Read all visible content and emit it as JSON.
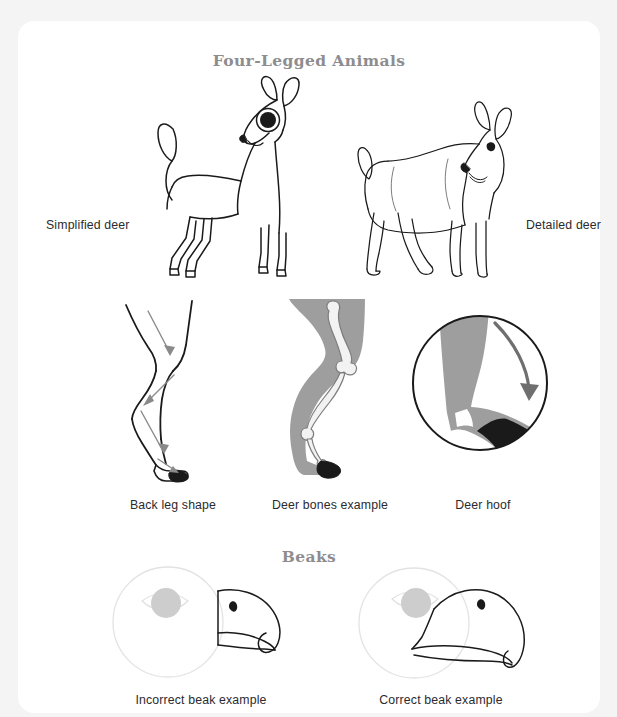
{
  "page": {
    "background_color": "#f4f4f5",
    "card_color": "#ffffff"
  },
  "colors": {
    "heading_gray": "#8d8d8f",
    "caption_dark": "#2b2b2f",
    "ink_black": "#1a1a1a",
    "silhouette_gray": "#9e9e9e",
    "arrow_gray": "#8a8a8a",
    "faint_outline": "#e2e2e4",
    "eye_fill_gray": "#c9c9c9"
  },
  "sections": [
    {
      "id": "four-legged-animals",
      "heading": "Four-Legged Animals",
      "rows": [
        {
          "id": "deer-bodies",
          "figures": [
            {
              "id": "simplified-deer",
              "caption": "Simplified deer",
              "caption_position": "left",
              "icon": "simplified-deer-illustration"
            },
            {
              "id": "detailed-deer",
              "caption": "Detailed deer",
              "caption_position": "right",
              "icon": "detailed-deer-illustration"
            }
          ]
        },
        {
          "id": "deer-anatomy",
          "figures": [
            {
              "id": "back-leg",
              "caption": "Back leg shape",
              "caption_position": "below",
              "icon": "deer-back-leg-illustration"
            },
            {
              "id": "deer-bones",
              "caption": "Deer bones example",
              "caption_position": "below",
              "icon": "deer-leg-bones-illustration"
            },
            {
              "id": "deer-hoof",
              "caption": "Deer hoof",
              "caption_position": "below",
              "icon": "deer-hoof-closeup-illustration"
            }
          ]
        }
      ]
    },
    {
      "id": "beaks",
      "heading": "Beaks",
      "rows": [
        {
          "id": "beak-comparison",
          "figures": [
            {
              "id": "incorrect-beak",
              "caption": "Incorrect beak example",
              "caption_position": "below",
              "icon": "incorrect-beak-illustration"
            },
            {
              "id": "correct-beak",
              "caption": "Correct beak example",
              "caption_position": "below",
              "icon": "correct-beak-illustration"
            }
          ]
        }
      ]
    }
  ],
  "headings": {
    "four_legged_animals": "Four-Legged Animals",
    "beaks": "Beaks"
  },
  "captions": {
    "simplified_deer": "Simplified deer",
    "detailed_deer": "Detailed deer",
    "back_leg_shape": "Back leg shape",
    "deer_bones_example": "Deer bones example",
    "deer_hoof": "Deer hoof",
    "incorrect_beak_example": "Incorrect beak example",
    "correct_beak_example": "Correct beak example"
  }
}
